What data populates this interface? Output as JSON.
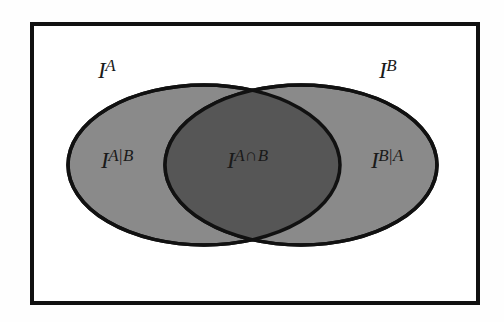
{
  "figure": {
    "type": "venn-diagram",
    "title": "",
    "background_color": "#fefefe",
    "frame": {
      "name": "universe-rectangle",
      "stroke_color": "#111111",
      "fill_color": "#ffffff",
      "stroke_width": 4
    },
    "colors": {
      "set_fill": "#8a8a8a",
      "intersection_fill": "#565656",
      "outline": "#111111",
      "text": "#1a1a1a"
    },
    "sets": [
      {
        "id": "set-a",
        "name": "left-ellipse-a",
        "label": "I",
        "superscript": "A",
        "fill": "#8a8a8a",
        "cx": 204,
        "cy": 165,
        "rx": 136,
        "ry": 80
      },
      {
        "id": "set-b",
        "name": "right-ellipse-b",
        "label": "I",
        "superscript": "B",
        "fill": "#8a8a8a",
        "cx": 301,
        "cy": 165,
        "rx": 136,
        "ry": 80
      }
    ],
    "regions": [
      {
        "id": "region-a-only",
        "name": "region-a-given-b",
        "base": "I",
        "sup_left": "A",
        "sup_sep": "|",
        "sup_right": "B",
        "fill": "#8a8a8a"
      },
      {
        "id": "region-intersection",
        "name": "region-a-intersect-b",
        "base": "I",
        "sup_left": "A",
        "sup_sep": "∩",
        "sup_right": "B",
        "fill": "#565656"
      },
      {
        "id": "region-b-only",
        "name": "region-b-given-a",
        "base": "I",
        "sup_left": "B",
        "sup_sep": "|",
        "sup_right": "A",
        "fill": "#8a8a8a"
      }
    ],
    "labels": {
      "set_a": {
        "base": "I",
        "sup": "A"
      },
      "set_b": {
        "base": "I",
        "sup": "B"
      },
      "a_given_b": {
        "base": "I",
        "sup_left": "A",
        "sup_sep": "|",
        "sup_right": "B"
      },
      "a_cap_b": {
        "base": "I",
        "sup_left": "A",
        "sup_sep": "∩",
        "sup_right": "B"
      },
      "b_given_a": {
        "base": "I",
        "sup_left": "B",
        "sup_sep": "|",
        "sup_right": "A"
      }
    }
  }
}
